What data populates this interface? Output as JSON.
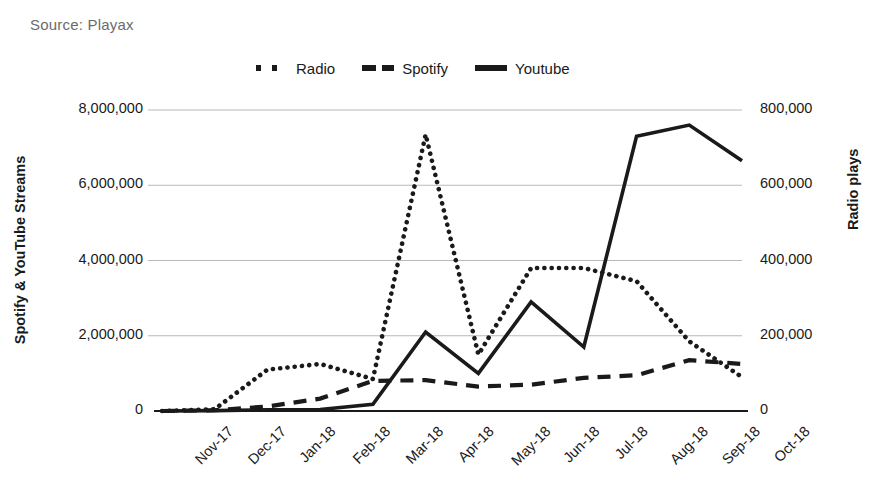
{
  "source": {
    "text": "Source: Playax"
  },
  "legend": {
    "position": "top-center",
    "entries": [
      {
        "label": "Radio",
        "style": "dotted",
        "color": "#1a1a1a"
      },
      {
        "label": "Spotify",
        "style": "dashed",
        "color": "#1a1a1a"
      },
      {
        "label": "Youtube",
        "style": "solid",
        "color": "#1a1a1a"
      }
    ]
  },
  "chart_data": {
    "type": "line",
    "title": "",
    "subtitle": "",
    "source": "Source: Playax",
    "xlabel": "",
    "ylabel": "Spotify & YouTube Streams",
    "y2label": "Radio plays",
    "grid": true,
    "categories": [
      "Nov-17",
      "Dec-17",
      "Jan-18",
      "Feb-18",
      "Mar-18",
      "Apr-18",
      "May-18",
      "Jun-18",
      "Jul-18",
      "Aug-18",
      "Sep-18",
      "Oct-18"
    ],
    "ylim": [
      0,
      8000000
    ],
    "yticks": [
      0,
      2000000,
      4000000,
      6000000,
      8000000
    ],
    "ytick_labels": [
      "0",
      "2,000,000",
      "4,000,000",
      "6,000,000",
      "8,000,000"
    ],
    "y2lim": [
      0,
      800000
    ],
    "y2ticks": [
      0,
      200000,
      400000,
      600000,
      800000
    ],
    "y2tick_labels": [
      "0",
      "200,000",
      "400,000",
      "600,000",
      "800,000"
    ],
    "series": [
      {
        "name": "Radio",
        "axis": "right",
        "style": "dotted",
        "color": "#1a1a1a",
        "values": [
          0,
          5000,
          110000,
          125000,
          85000,
          735000,
          150000,
          380000,
          380000,
          345000,
          185000,
          90000
        ]
      },
      {
        "name": "Spotify",
        "axis": "left",
        "style": "dashed",
        "color": "#1a1a1a",
        "values": [
          0,
          20000,
          120000,
          330000,
          800000,
          820000,
          650000,
          700000,
          880000,
          950000,
          1350000,
          1250000
        ]
      },
      {
        "name": "Youtube",
        "axis": "left",
        "style": "solid",
        "color": "#1a1a1a",
        "values": [
          0,
          10000,
          30000,
          40000,
          180000,
          2100000,
          1000000,
          2900000,
          1700000,
          7300000,
          7600000,
          6650000
        ]
      }
    ]
  },
  "axes": {
    "left_title": "Spotify & YouTube Streams",
    "right_title": "Radio plays"
  },
  "colors": {
    "ink": "#1a1a1a",
    "grid": "#b9b9b9",
    "axis": "#1a1a1a",
    "caption": "#6b6b6b",
    "background": "#ffffff"
  }
}
